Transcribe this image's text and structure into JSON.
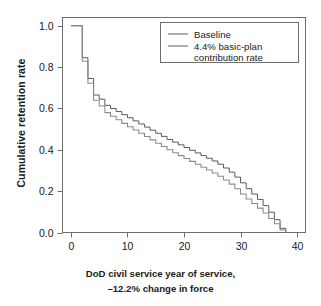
{
  "figure": {
    "background": "#ffffff",
    "axis_color": "#6e6e6e",
    "text_color": "#1a1a1a"
  },
  "axis": {
    "ylabel": "Cumulative retention rate",
    "xlabel_line1": "DoD civil service year of service,",
    "xlabel_line2": "–12.2% change in force",
    "xticklabels": [
      "0",
      "10",
      "20",
      "30",
      "40"
    ],
    "yticklabels": [
      "0.0",
      "0.2",
      "0.4",
      "0.6",
      "0.8",
      "1.0"
    ]
  },
  "legend": {
    "items": [
      {
        "label": "Baseline",
        "color": "#5a5a5a"
      },
      {
        "label": "4.4% basic-plan",
        "label2": "contribution rate",
        "color": "#8a8a8a"
      }
    ]
  },
  "chart_data": {
    "type": "line",
    "subtype": "step",
    "title": "",
    "xlabel": "DoD civil service year of service, –12.2% change in force",
    "ylabel": "Cumulative retention rate",
    "xlim": [
      -1.5,
      41.5
    ],
    "ylim": [
      0.0,
      1.04
    ],
    "xticks": [
      0,
      10,
      20,
      30,
      40
    ],
    "yticks": [
      0.0,
      0.2,
      0.4,
      0.6,
      0.8,
      1.0
    ],
    "grid": false,
    "legend_position": "upper right",
    "x": [
      0,
      1,
      2,
      3,
      4,
      5,
      6,
      7,
      8,
      9,
      10,
      11,
      12,
      13,
      14,
      15,
      16,
      17,
      18,
      19,
      20,
      21,
      22,
      23,
      24,
      25,
      26,
      27,
      28,
      29,
      30,
      31,
      32,
      33,
      34,
      35,
      36,
      37,
      38
    ],
    "series": [
      {
        "name": "Baseline",
        "color": "#5a5a5a",
        "values": [
          1.0,
          1.0,
          0.845,
          0.745,
          0.665,
          0.645,
          0.615,
          0.6,
          0.585,
          0.57,
          0.555,
          0.54,
          0.525,
          0.51,
          0.495,
          0.48,
          0.465,
          0.45,
          0.437,
          0.424,
          0.411,
          0.398,
          0.385,
          0.372,
          0.359,
          0.346,
          0.33,
          0.312,
          0.292,
          0.268,
          0.24,
          0.212,
          0.186,
          0.16,
          0.13,
          0.098,
          0.062,
          0.02,
          0.0
        ]
      },
      {
        "name": "4.4% basic-plan contribution rate",
        "color": "#8a8a8a",
        "values": [
          1.0,
          1.0,
          0.828,
          0.722,
          0.64,
          0.612,
          0.58,
          0.562,
          0.545,
          0.528,
          0.512,
          0.496,
          0.48,
          0.464,
          0.448,
          0.432,
          0.416,
          0.4,
          0.386,
          0.372,
          0.358,
          0.344,
          0.33,
          0.316,
          0.302,
          0.288,
          0.272,
          0.254,
          0.234,
          0.212,
          0.186,
          0.162,
          0.14,
          0.118,
          0.094,
          0.068,
          0.042,
          0.012,
          0.0
        ]
      }
    ]
  }
}
